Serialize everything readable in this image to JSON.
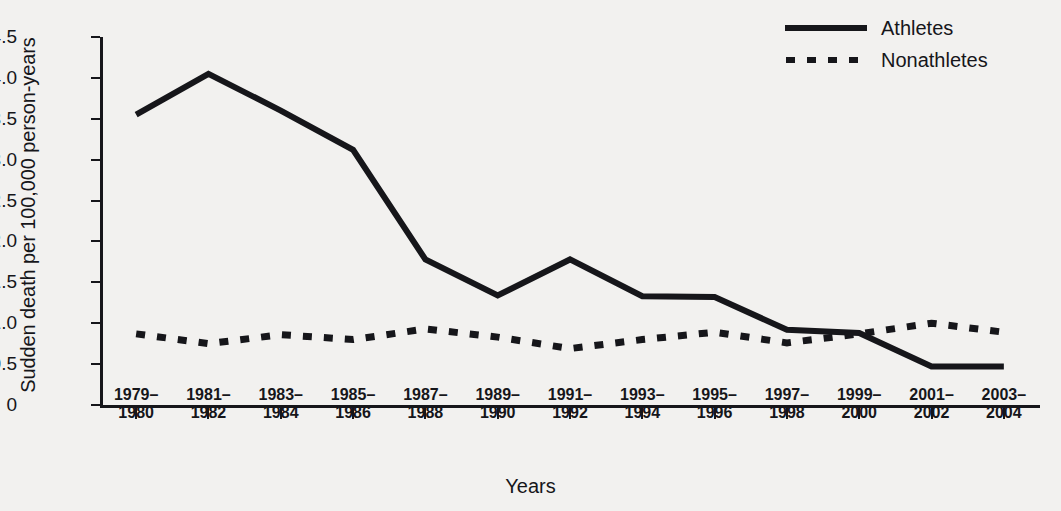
{
  "chart_data": {
    "type": "line",
    "title": "",
    "xlabel": "Years",
    "ylabel": "Sudden death per 100,000 person-years",
    "ylim": [
      0,
      4.5
    ],
    "yticks": [
      "0",
      "0.5",
      "1.0",
      "1.5",
      "2.0",
      "2.5",
      "3.0",
      "3.5",
      "4.0",
      "4.5"
    ],
    "ytick_values": [
      0,
      0.5,
      1.0,
      1.5,
      2.0,
      2.5,
      3.0,
      3.5,
      4.0,
      4.5
    ],
    "grid": false,
    "legend_position": "top-right",
    "categories": [
      "1979–1980",
      "1981–1982",
      "1983–1984",
      "1985–1986",
      "1987–1988",
      "1989–1990",
      "1991–1992",
      "1993–1994",
      "1995–1996",
      "1997–1998",
      "1999–2000",
      "2001–2002",
      "2003–2004"
    ],
    "categories_lines": [
      [
        "1979–",
        "1980"
      ],
      [
        "1981–",
        "1982"
      ],
      [
        "1983–",
        "1984"
      ],
      [
        "1985–",
        "1986"
      ],
      [
        "1987–",
        "1988"
      ],
      [
        "1989–",
        "1990"
      ],
      [
        "1991–",
        "1992"
      ],
      [
        "1993–",
        "1994"
      ],
      [
        "1995–",
        "1996"
      ],
      [
        "1997–",
        "1998"
      ],
      [
        "1999–",
        "2000"
      ],
      [
        "2001–",
        "2002"
      ],
      [
        "2003–",
        "2004"
      ]
    ],
    "series": [
      {
        "name": "Athletes",
        "style": "solid",
        "color": "#16161a",
        "values": [
          3.55,
          4.05,
          3.6,
          3.12,
          1.78,
          1.34,
          1.78,
          1.33,
          1.32,
          0.92,
          0.88,
          0.47,
          0.47
        ]
      },
      {
        "name": "Nonathletes",
        "style": "dotted",
        "color": "#16161a",
        "values": [
          0.87,
          0.75,
          0.86,
          0.8,
          0.93,
          0.83,
          0.69,
          0.8,
          0.89,
          0.76,
          0.87,
          1.0,
          0.89
        ]
      }
    ]
  },
  "legend": {
    "items": [
      {
        "label": "Athletes",
        "style": "solid"
      },
      {
        "label": "Nonathletes",
        "style": "dotted"
      }
    ]
  }
}
